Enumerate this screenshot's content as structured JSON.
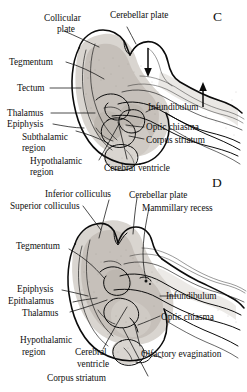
{
  "figure": {
    "panels": [
      {
        "letter": "C",
        "name": "panel-c",
        "labels": [
          {
            "id": "c-collicular-plate",
            "text_line1": "Collicular",
            "text_line2": "plate"
          },
          {
            "id": "c-cerebellar-plate",
            "text": "Cerebellar plate"
          },
          {
            "id": "c-tegmentum",
            "text": "Tegmentum"
          },
          {
            "id": "c-tectum",
            "text": "Tectum"
          },
          {
            "id": "c-thalamus",
            "text": "Thalamus"
          },
          {
            "id": "c-epiphysis",
            "text": "Epiphysis"
          },
          {
            "id": "c-subthalamic-region",
            "text_line1": "Subthalamic",
            "text_line2": "region"
          },
          {
            "id": "c-hypothalamic-region",
            "text_line1": "Hypothalamic",
            "text_line2": "region"
          },
          {
            "id": "c-infundibulum",
            "text": "Infundibulum"
          },
          {
            "id": "c-optic-chiasma",
            "text": "Optic chiasma"
          },
          {
            "id": "c-corpus-striatum",
            "text": "Corpus striatum"
          },
          {
            "id": "c-cerebral-ventricle",
            "text": "Cerebral ventricle"
          }
        ]
      },
      {
        "letter": "D",
        "name": "panel-d",
        "labels": [
          {
            "id": "d-inferior-colliculus",
            "text": "Inferior colliculus"
          },
          {
            "id": "d-superior-colliculus",
            "text": "Superior colliculus"
          },
          {
            "id": "d-cerebellar-plate",
            "text": "Cerebellar plate"
          },
          {
            "id": "d-mammillary-recess",
            "text": "Mammillary recess"
          },
          {
            "id": "d-tegmentum",
            "text": "Tegmentum"
          },
          {
            "id": "d-epiphysis",
            "text": "Epiphysis"
          },
          {
            "id": "d-epithalamus",
            "text": "Epithalamus"
          },
          {
            "id": "d-thalamus",
            "text": "Thalamus"
          },
          {
            "id": "d-hypothalamic-region",
            "text_line1": "Hypothalamic",
            "text_line2": "region"
          },
          {
            "id": "d-cerebral-ventricle",
            "text_line1": "Cerebral",
            "text_line2": "ventricle"
          },
          {
            "id": "d-corpus-striatum",
            "text": "Corpus striatum"
          },
          {
            "id": "d-infundibulum",
            "text": "Infundibulum"
          },
          {
            "id": "d-optic-chiasma",
            "text": "Optic chiasma"
          },
          {
            "id": "d-olfactory-evagination",
            "text": "Olfactory evagination"
          }
        ]
      }
    ],
    "colors": {
      "ink": "#101010",
      "page": "#ffffff",
      "tissue_light": "#d9d5d0",
      "tissue_mid": "#cfcac4",
      "tissue_dark": "#bdb7b0"
    },
    "annotations": {
      "arrows": [
        {
          "id": "c-arrow-down",
          "direction": "down"
        },
        {
          "id": "c-arrow-up",
          "direction": "up"
        }
      ]
    }
  }
}
